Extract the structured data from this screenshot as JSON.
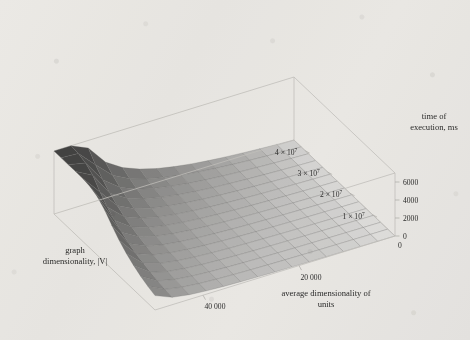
{
  "figure": {
    "kind": "3d-surface-plot",
    "background_color": "#f3f2f0",
    "frame_color": "#c9c8c5",
    "text_color": "#2b2b2b"
  },
  "chart_data": {
    "type": "surface",
    "title": "",
    "subtitle": "",
    "xlabel": "average dimensionality of units",
    "ylabel": "graph dimensionality, |V|",
    "zlabel": "time of execution, ms",
    "grid": true,
    "legend": "none",
    "colormap": "grayscale",
    "colormap_low": "#3f3f3f",
    "colormap_high": "#fbfbfb",
    "mesh_divisions": 15,
    "xticks": [
      {
        "value": 20000,
        "label": "20 000"
      },
      {
        "value": 40000,
        "label": "40 000"
      }
    ],
    "yticks": [
      {
        "value": 10000000,
        "mantissa": "1 × 10",
        "exponent": "7"
      },
      {
        "value": 20000000,
        "mantissa": "2 × 10",
        "exponent": "7"
      },
      {
        "value": 30000000,
        "mantissa": "3 × 10",
        "exponent": "7"
      },
      {
        "value": 40000000,
        "mantissa": "4 × 10",
        "exponent": "7"
      }
    ],
    "zticks": [
      {
        "value": 0,
        "label": "0"
      },
      {
        "value": 2000,
        "label": "2000"
      },
      {
        "value": 4000,
        "label": "4000"
      },
      {
        "value": 6000,
        "label": "6000"
      }
    ],
    "origin_tick_label": "0",
    "xlim": [
      0,
      50000
    ],
    "ylim": [
      0,
      45000000
    ],
    "zlim": [
      0,
      7000
    ],
    "x": [
      0,
      3571,
      7143,
      10714,
      14286,
      17857,
      21429,
      25000,
      28571,
      32143,
      35714,
      39286,
      42857,
      46429,
      50000
    ],
    "y": [
      0,
      3214286,
      6428571,
      9642857,
      12857143,
      16071429,
      19285714,
      22500000,
      25714286,
      28928571,
      32142857,
      35357143,
      38571429,
      41785714,
      45000000
    ],
    "z": [
      [
        0,
        10,
        22,
        36,
        52,
        71,
        94,
        122,
        158,
        205,
        270,
        366,
        522,
        820,
        1600
      ],
      [
        0,
        12,
        26,
        42,
        60,
        82,
        108,
        140,
        182,
        236,
        310,
        420,
        600,
        945,
        1880
      ],
      [
        0,
        14,
        30,
        49,
        70,
        95,
        125,
        163,
        211,
        274,
        360,
        488,
        700,
        1110,
        2240
      ],
      [
        0,
        16,
        35,
        57,
        81,
        110,
        145,
        189,
        245,
        318,
        418,
        568,
        818,
        1310,
        2700
      ],
      [
        0,
        19,
        41,
        66,
        94,
        128,
        169,
        220,
        285,
        371,
        488,
        665,
        962,
        1555,
        3270
      ],
      [
        0,
        22,
        48,
        77,
        110,
        149,
        197,
        257,
        333,
        434,
        572,
        782,
        1138,
        1860,
        3980
      ],
      [
        0,
        26,
        56,
        90,
        128,
        174,
        230,
        300,
        390,
        509,
        672,
        923,
        1352,
        2240,
        4840
      ],
      [
        0,
        30,
        65,
        105,
        150,
        204,
        270,
        353,
        459,
        601,
        796,
        1097,
        1618,
        2710,
        5800
      ],
      [
        0,
        35,
        76,
        123,
        176,
        239,
        317,
        415,
        541,
        710,
        944,
        1307,
        1940,
        3290,
        6500
      ],
      [
        0,
        41,
        89,
        144,
        206,
        281,
        373,
        490,
        640,
        843,
        1124,
        1564,
        2336,
        4010,
        6850
      ],
      [
        0,
        48,
        104,
        169,
        242,
        331,
        440,
        579,
        759,
        1003,
        1343,
        1878,
        2822,
        4900,
        6980
      ],
      [
        0,
        56,
        122,
        198,
        285,
        390,
        520,
        686,
        902,
        1197,
        1610,
        2263,
        3420,
        6000,
        7000
      ],
      [
        0,
        66,
        143,
        233,
        336,
        461,
        616,
        815,
        1075,
        1432,
        1934,
        2732,
        4150,
        6600,
        7000
      ],
      [
        0,
        78,
        168,
        274,
        396,
        545,
        731,
        970,
        1284,
        1718,
        2330,
        3305,
        5050,
        6900,
        7000
      ],
      [
        0,
        92,
        198,
        323,
        468,
        646,
        868,
        1156,
        1535,
        2064,
        2812,
        4010,
        6150,
        7000,
        7000
      ]
    ]
  }
}
